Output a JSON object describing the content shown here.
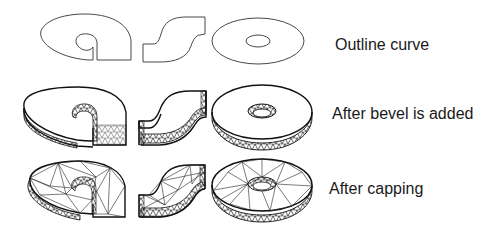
{
  "figure": {
    "shapes": [
      "a",
      "s",
      "o"
    ],
    "rows": [
      {
        "id": "outline",
        "label": "Outline curve"
      },
      {
        "id": "bevel",
        "label": "After bevel is added"
      },
      {
        "id": "capping",
        "label": "After capping"
      }
    ],
    "colors": {
      "background": "#ffffff",
      "stroke": "#222222",
      "text": "#1a1a1a"
    }
  }
}
